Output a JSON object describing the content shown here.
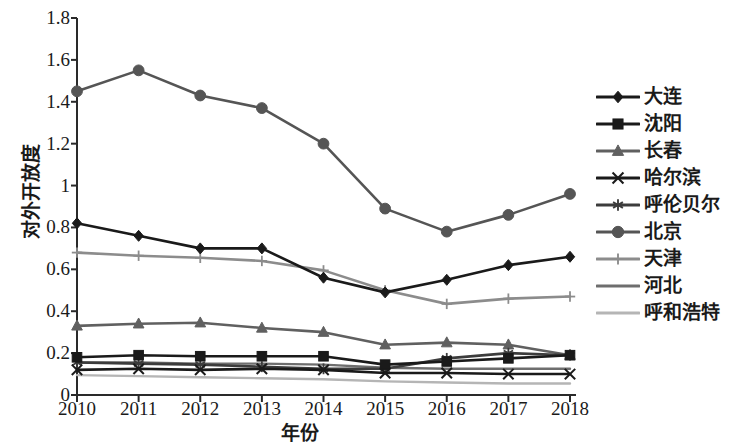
{
  "chart_data": {
    "type": "line",
    "title": "",
    "xlabel": "年份",
    "ylabel": "对外开放度",
    "x": [
      "2010",
      "2011",
      "2012",
      "2013",
      "2014",
      "2015",
      "2016",
      "2017",
      "2018"
    ],
    "categories": [
      "2010",
      "2011",
      "2012",
      "2013",
      "2014",
      "2015",
      "2016",
      "2017",
      "2018"
    ],
    "xlim": [
      2010,
      2018
    ],
    "ylim": [
      0,
      1.8
    ],
    "yticks": [
      "0",
      "0.2",
      "0.4",
      "0.6",
      "0.8",
      "1",
      "1.2",
      "1.4",
      "1.6",
      "1.8"
    ],
    "ytick_values": [
      0,
      0.2,
      0.4,
      0.6,
      0.8,
      1.0,
      1.2,
      1.4,
      1.6,
      1.8
    ],
    "grid": false,
    "legend_position": "right",
    "series": [
      {
        "name": "大连",
        "marker": "diamond",
        "color": "#1a1a1a",
        "values": [
          0.82,
          0.76,
          0.7,
          0.7,
          0.56,
          0.49,
          0.55,
          0.62,
          0.66
        ]
      },
      {
        "name": "沈阳",
        "marker": "square",
        "color": "#1a1a1a",
        "values": [
          0.18,
          0.19,
          0.185,
          0.185,
          0.185,
          0.145,
          0.16,
          0.175,
          0.19
        ]
      },
      {
        "name": "长春",
        "marker": "triangle",
        "color": "#606060",
        "values": [
          0.33,
          0.34,
          0.345,
          0.32,
          0.3,
          0.24,
          0.25,
          0.24,
          0.19
        ]
      },
      {
        "name": "哈尔滨",
        "marker": "x",
        "color": "#1a1a1a",
        "values": [
          0.12,
          0.125,
          0.12,
          0.125,
          0.12,
          0.105,
          0.105,
          0.1,
          0.1
        ]
      },
      {
        "name": "呼伦贝尔",
        "marker": "asterisk",
        "color": "#3c3c3c",
        "values": [
          0.155,
          0.15,
          0.145,
          0.135,
          0.125,
          0.125,
          0.175,
          0.2,
          0.19
        ]
      },
      {
        "name": "北京",
        "marker": "circle",
        "color": "#555555",
        "values": [
          1.45,
          1.55,
          1.43,
          1.37,
          1.2,
          0.89,
          0.78,
          0.86,
          0.96
        ]
      },
      {
        "name": "天津",
        "marker": "plus",
        "color": "#8c8c8c",
        "values": [
          0.68,
          0.665,
          0.655,
          0.64,
          0.595,
          0.5,
          0.435,
          0.46,
          0.47
        ]
      },
      {
        "name": "河北",
        "marker": "none",
        "color": "#6e6e6e",
        "values": [
          0.155,
          0.155,
          0.15,
          0.15,
          0.145,
          0.13,
          0.125,
          0.125,
          0.125
        ]
      },
      {
        "name": "呼和浩特",
        "marker": "none",
        "color": "#b5b5b5",
        "values": [
          0.095,
          0.09,
          0.085,
          0.08,
          0.075,
          0.065,
          0.06,
          0.055,
          0.055
        ]
      }
    ]
  },
  "axes": {
    "y_title": "对外开放度",
    "x_title": "年份"
  }
}
